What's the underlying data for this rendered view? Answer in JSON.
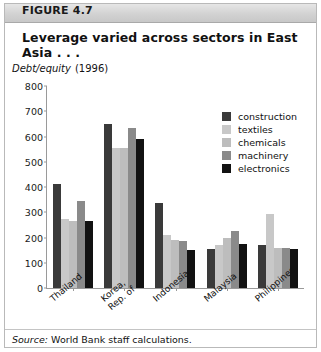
{
  "figure": {
    "header_label": "FIGURE 4.7",
    "title": "Leverage varied across sectors in East Asia  . . .",
    "axis_unit_italic": "Debt/equity",
    "axis_unit_year": "(1996)",
    "source_prefix": "Source:",
    "source_text": "World Bank staff calculations."
  },
  "colors": {
    "construction": "#3a3a3a",
    "textiles": "#c8c8c8",
    "chemicals": "#bdbdbd",
    "machinery": "#8a8a8a",
    "electronics": "#121212",
    "axis": "#9a9a9a",
    "header_bg": "#d2d2d2",
    "frame": "#b9b9b9"
  },
  "chart_data": {
    "type": "bar",
    "title": "Leverage varied across sectors in East Asia  . . .",
    "xlabel": "",
    "ylabel": "Debt/equity (1996)",
    "ylim": [
      0,
      800
    ],
    "yticks": [
      0,
      100,
      200,
      300,
      400,
      500,
      600,
      700,
      800
    ],
    "grid": false,
    "legend_position": "upper-right",
    "categories": [
      "Thailand",
      "Korea, Rep. of",
      "Indonesia",
      "Malaysia",
      "Philippines"
    ],
    "category_lines": [
      [
        "Thailand"
      ],
      [
        "Korea,",
        "Rep. of"
      ],
      [
        "Indonesia"
      ],
      [
        "Malaysia"
      ],
      [
        "Philippines"
      ]
    ],
    "series": [
      {
        "name": "construction",
        "color": "#3a3a3a",
        "values": [
          410,
          650,
          335,
          155,
          170
        ]
      },
      {
        "name": "textiles",
        "color": "#c8c8c8",
        "values": [
          275,
          555,
          210,
          170,
          295
        ]
      },
      {
        "name": "chemicals",
        "color": "#bdbdbd",
        "values": [
          265,
          555,
          190,
          200,
          160
        ]
      },
      {
        "name": "machinery",
        "color": "#8a8a8a",
        "values": [
          345,
          635,
          185,
          225,
          160
        ]
      },
      {
        "name": "electronics",
        "color": "#121212",
        "values": [
          265,
          590,
          150,
          175,
          155
        ]
      }
    ]
  }
}
